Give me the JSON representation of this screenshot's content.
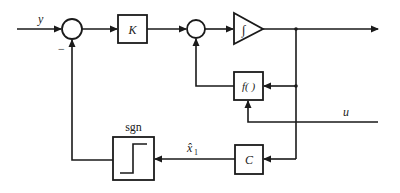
{
  "diagram": {
    "type": "block-diagram",
    "signals": {
      "input": "y",
      "external_input": "u",
      "estimate": "x̂",
      "estimate_subscript": "1",
      "feedback_sign": "−"
    },
    "blocks": {
      "gain": "K",
      "nonlinear": "f( )",
      "output_matrix": "C",
      "sign_function_label": "sgn",
      "integrator_symbol": "∫"
    },
    "colors": {
      "stroke": "#1a1a1a",
      "background": "#ffffff"
    }
  }
}
